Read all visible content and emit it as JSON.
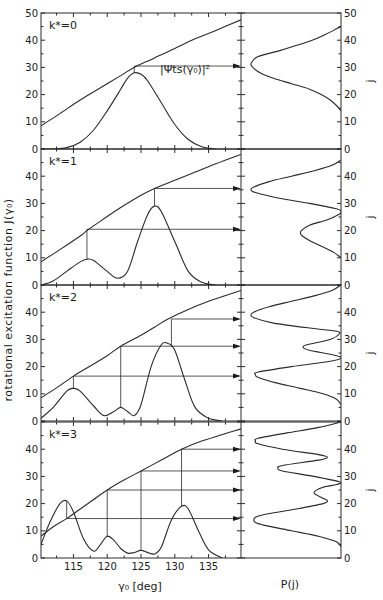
{
  "figure": {
    "y_axis_label": "rotational excitation function  J(γ₀)",
    "x_axis_label": "γ₀ [deg]",
    "right_x_label": "P(j)",
    "right_y_label": "j",
    "annotation": "|Ψts(γ₀)|²"
  },
  "chart_data": [
    {
      "type": "line",
      "panel": "k*=0",
      "title": "k* = 0",
      "xlabel": "γ₀ [deg]",
      "ylabel": "J(γ₀)",
      "xlim": [
        110.2,
        139.8
      ],
      "ylim": [
        0,
        50
      ],
      "y_ticks": [
        0,
        10,
        20,
        30,
        40,
        50
      ],
      "x_ticks": [
        115,
        120,
        125,
        130,
        135
      ],
      "annotation": "|Ψts(γ₀)|²",
      "series": [
        {
          "name": "J(γ₀)",
          "x": [
            110.2,
            113,
            116,
            119,
            122,
            124,
            127,
            130,
            133,
            136,
            139.8
          ],
          "y": [
            8.5,
            13,
            18,
            22.5,
            27,
            30,
            33.5,
            37,
            40.5,
            43.5,
            47.5
          ]
        },
        {
          "name": "|Ψts(γ₀)|²",
          "x": [
            110.2,
            112,
            114,
            116,
            118,
            120,
            122,
            123,
            124,
            125,
            126,
            128,
            130,
            132,
            134,
            136
          ],
          "y": [
            0,
            0,
            0.5,
            2.5,
            7,
            14,
            22,
            26,
            28,
            27.5,
            25,
            17,
            9,
            3.5,
            0.8,
            0
          ]
        }
      ],
      "arrows": [
        {
          "gamma": 124,
          "J": 30.5
        }
      ],
      "p_of_j": {
        "j": [
          14,
          16,
          18,
          20,
          22,
          24,
          26,
          28,
          30,
          31,
          32,
          34,
          36,
          38,
          40,
          42,
          44,
          45
        ],
        "p": [
          0,
          0.05,
          0.12,
          0.22,
          0.35,
          0.55,
          0.75,
          0.9,
          0.98,
          1.0,
          0.99,
          0.92,
          0.7,
          0.5,
          0.32,
          0.18,
          0.06,
          0
        ]
      }
    },
    {
      "type": "line",
      "panel": "k*=1",
      "title": "k* = 1",
      "xlim": [
        110.2,
        139.8
      ],
      "ylim": [
        0,
        50
      ],
      "y_ticks": [
        0,
        10,
        20,
        30,
        40
      ],
      "series": [
        {
          "name": "J(γ₀)",
          "x": [
            110.2,
            113,
            116,
            117,
            119,
            122,
            125,
            127,
            130,
            133,
            136,
            139.8
          ],
          "y": [
            8.5,
            13,
            18,
            20,
            23.5,
            28.5,
            33,
            35.5,
            38.5,
            41.5,
            44.5,
            48
          ]
        },
        {
          "name": "|Ψts(γ₀)|²",
          "x": [
            110.2,
            112,
            114,
            116,
            117,
            118,
            120,
            121.5,
            123,
            124.5,
            126,
            127,
            128,
            130,
            132,
            134,
            136
          ],
          "y": [
            0,
            1.5,
            5,
            8.5,
            9.5,
            9,
            5,
            2.5,
            5,
            16,
            26,
            29,
            27,
            16,
            5,
            1,
            0
          ]
        }
      ],
      "arrows": [
        {
          "gamma": 117,
          "J": 20.5
        },
        {
          "gamma": 127,
          "J": 35.5
        }
      ],
      "p_of_j": {
        "j": [
          10,
          12,
          14,
          16,
          18,
          19,
          20,
          22,
          24,
          26,
          27,
          28,
          30,
          32,
          34,
          35,
          36,
          38,
          40,
          42,
          44,
          46
        ],
        "p": [
          0,
          0.08,
          0.2,
          0.33,
          0.43,
          0.45,
          0.44,
          0.35,
          0.15,
          0.02,
          0.0,
          0.05,
          0.35,
          0.7,
          0.95,
          1.0,
          0.97,
          0.8,
          0.55,
          0.3,
          0.1,
          0
        ]
      }
    },
    {
      "type": "line",
      "panel": "k*=2",
      "title": "k* = 2",
      "xlim": [
        110.2,
        139.8
      ],
      "ylim": [
        0,
        50
      ],
      "y_ticks": [
        0,
        10,
        20,
        30,
        40
      ],
      "series": [
        {
          "name": "J(γ₀)",
          "x": [
            110.2,
            113,
            115,
            117,
            120,
            122,
            125,
            127,
            129,
            132,
            135,
            139.8
          ],
          "y": [
            8.5,
            13,
            16.5,
            19.5,
            24,
            27.5,
            31.5,
            34.5,
            37.5,
            41,
            44,
            48
          ]
        },
        {
          "name": "|Ψts(γ₀)|²",
          "x": [
            110.2,
            112,
            114,
            115,
            116,
            118,
            119.5,
            121,
            122,
            123,
            124,
            125,
            126.5,
            128,
            129,
            130,
            131.5,
            133,
            135,
            137
          ],
          "y": [
            1,
            5,
            11,
            12,
            11,
            5.5,
            2,
            3.5,
            5,
            3.5,
            2,
            6,
            20,
            28,
            28.5,
            26,
            15,
            5,
            1,
            0
          ]
        }
      ],
      "arrows": [
        {
          "gamma": 115,
          "J": 16.5
        },
        {
          "gamma": 122,
          "J": 27.5
        },
        {
          "gamma": 129.5,
          "J": 37.5
        }
      ],
      "p_of_j": {
        "j": [
          6,
          8,
          10,
          12,
          14,
          16,
          17,
          18,
          20,
          22,
          23,
          24,
          26,
          27,
          28,
          30,
          32,
          33,
          34,
          36,
          38,
          39,
          40,
          42,
          44,
          46,
          48,
          50
        ],
        "p": [
          0,
          0.05,
          0.2,
          0.45,
          0.72,
          0.92,
          0.95,
          0.92,
          0.55,
          0.12,
          0.0,
          0.05,
          0.35,
          0.42,
          0.38,
          0.12,
          0.02,
          0.05,
          0.3,
          0.75,
          0.97,
          1.0,
          0.97,
          0.8,
          0.55,
          0.3,
          0.1,
          0
        ]
      }
    },
    {
      "type": "line",
      "panel": "k*=3",
      "title": "k* = 3",
      "xlim": [
        110.2,
        139.8
      ],
      "ylim": [
        0,
        50
      ],
      "y_ticks": [
        0,
        10,
        20,
        30,
        40
      ],
      "x_ticks": [
        115,
        120,
        125,
        130,
        135
      ],
      "series": [
        {
          "name": "J(γ₀)",
          "x": [
            110.2,
            112,
            114,
            116,
            118,
            120,
            122,
            125,
            128,
            131,
            134,
            139.8
          ],
          "y": [
            8,
            11.5,
            14.5,
            18,
            21.5,
            25,
            28,
            32,
            36,
            40,
            43,
            47.5
          ]
        },
        {
          "name": "|Ψts(γ₀)|²",
          "x": [
            110.2,
            111.5,
            113,
            114,
            115,
            116.5,
            118,
            119,
            120,
            121,
            122,
            123,
            124,
            125,
            126,
            127,
            128,
            129.5,
            131,
            132,
            133.5,
            135,
            137
          ],
          "y": [
            5,
            13,
            20,
            21,
            17,
            7,
            2.5,
            5,
            8,
            6.5,
            3.5,
            1.8,
            2,
            2.8,
            2,
            1.5,
            4,
            14,
            19,
            18,
            10,
            3,
            0
          ]
        }
      ],
      "arrows": [
        {
          "gamma": 114,
          "J": 14.5
        },
        {
          "gamma": 120,
          "J": 25
        },
        {
          "gamma": 125,
          "J": 32
        },
        {
          "gamma": 131,
          "J": 40
        }
      ],
      "p_of_j": {
        "j": [
          4,
          6,
          8,
          10,
          12,
          13,
          14,
          15,
          16,
          18,
          20,
          21,
          22,
          24,
          26,
          27,
          28,
          30,
          32,
          33,
          34,
          36,
          37,
          38,
          40,
          42,
          43,
          44,
          46,
          48,
          50
        ],
        "p": [
          0,
          0.05,
          0.25,
          0.55,
          0.85,
          0.95,
          0.97,
          0.95,
          0.85,
          0.5,
          0.2,
          0.15,
          0.2,
          0.3,
          0.2,
          0.05,
          0.02,
          0.3,
          0.65,
          0.7,
          0.65,
          0.25,
          0.15,
          0.25,
          0.65,
          0.92,
          0.95,
          0.92,
          0.6,
          0.25,
          0
        ]
      }
    }
  ]
}
